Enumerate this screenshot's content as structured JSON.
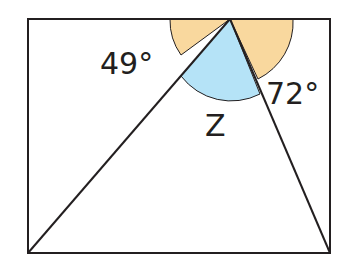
{
  "diagram": {
    "labels": {
      "left_angle": "49°",
      "right_angle": "72°",
      "unknown_angle": "Z"
    },
    "colors": {
      "outer_angle_fill": "#f9d89e",
      "inner_angle_fill": "#b5e3f7",
      "stroke": "#231f20",
      "background": "#ffffff"
    }
  }
}
